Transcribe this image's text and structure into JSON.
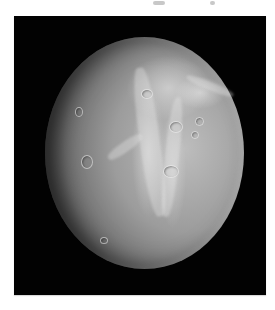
{
  "image": {
    "subject": "cratered icy moon with bright wispy fractures",
    "background_color": "#ffffff",
    "frame_color": "#020202",
    "moon_highlight_color": "#bdbdbd",
    "moon_shadow_color": "#3a3a3a"
  }
}
